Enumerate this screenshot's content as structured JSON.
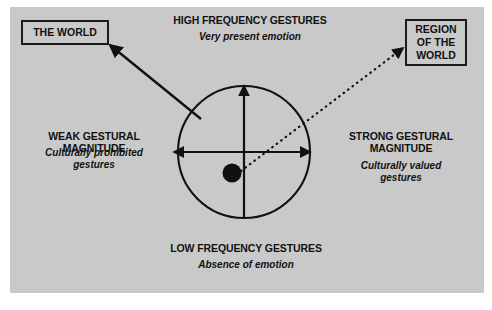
{
  "diagram": {
    "title_hidden": "",
    "background_color": "#c9c9c9",
    "ink_color": "#111111",
    "boxes": [
      {
        "id": "the-world",
        "label": "THE WORLD"
      },
      {
        "id": "region-of-the-world",
        "label": "REGION\nOF THE\nWORLD"
      }
    ],
    "axis_labels": {
      "top": {
        "heading": "HIGH FREQUENCY GESTURES",
        "subtitle": "Very present emotion"
      },
      "bottom": {
        "heading": "LOW FREQUENCY GESTURES",
        "subtitle": "Absence of emotion"
      },
      "left": {
        "heading": "WEAK GESTURAL MAGNITUDE",
        "subtitle": "Culturally prohibited\ngestures"
      },
      "right": {
        "heading": "STRONG GESTURAL\nMAGNITUDE",
        "subtitle": "Culturally valued\ngestures"
      }
    },
    "marker": {
      "name": "position-dot",
      "shape": "filled-circle"
    },
    "connectors": [
      {
        "id": "solid-arrow-to-the-world",
        "style": "solid",
        "from": "circle-upper-left",
        "to": "the-world-box"
      },
      {
        "id": "dotted-arrow-to-region",
        "style": "dotted",
        "from": "position-dot",
        "to": "region-of-the-world-box"
      }
    ]
  }
}
